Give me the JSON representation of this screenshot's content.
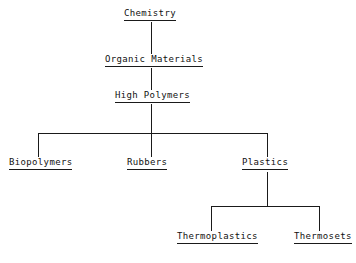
{
  "diagram": {
    "type": "hierarchy-tree",
    "background_color": "#ffffff",
    "line_color": "#1a1a1a",
    "text_color": "#111111",
    "nodes": [
      {
        "id": "chemistry",
        "label": "Chemistry",
        "level": 0
      },
      {
        "id": "organic",
        "label": "Organic Materials",
        "level": 1
      },
      {
        "id": "high-polymers",
        "label": "High Polymers",
        "level": 2
      },
      {
        "id": "biopolymers",
        "label": "Biopolymers",
        "level": 3
      },
      {
        "id": "rubbers",
        "label": "Rubbers",
        "level": 3
      },
      {
        "id": "plastics",
        "label": "Plastics",
        "level": 3
      },
      {
        "id": "thermoplastics",
        "label": "Thermoplastics",
        "level": 4
      },
      {
        "id": "thermosets",
        "label": "Thermosets",
        "level": 4
      }
    ],
    "edges": [
      {
        "from": "chemistry",
        "to": "organic"
      },
      {
        "from": "organic",
        "to": "high-polymers"
      },
      {
        "from": "high-polymers",
        "to": "biopolymers"
      },
      {
        "from": "high-polymers",
        "to": "rubbers"
      },
      {
        "from": "high-polymers",
        "to": "plastics"
      },
      {
        "from": "plastics",
        "to": "thermoplastics"
      },
      {
        "from": "plastics",
        "to": "thermosets"
      }
    ]
  }
}
